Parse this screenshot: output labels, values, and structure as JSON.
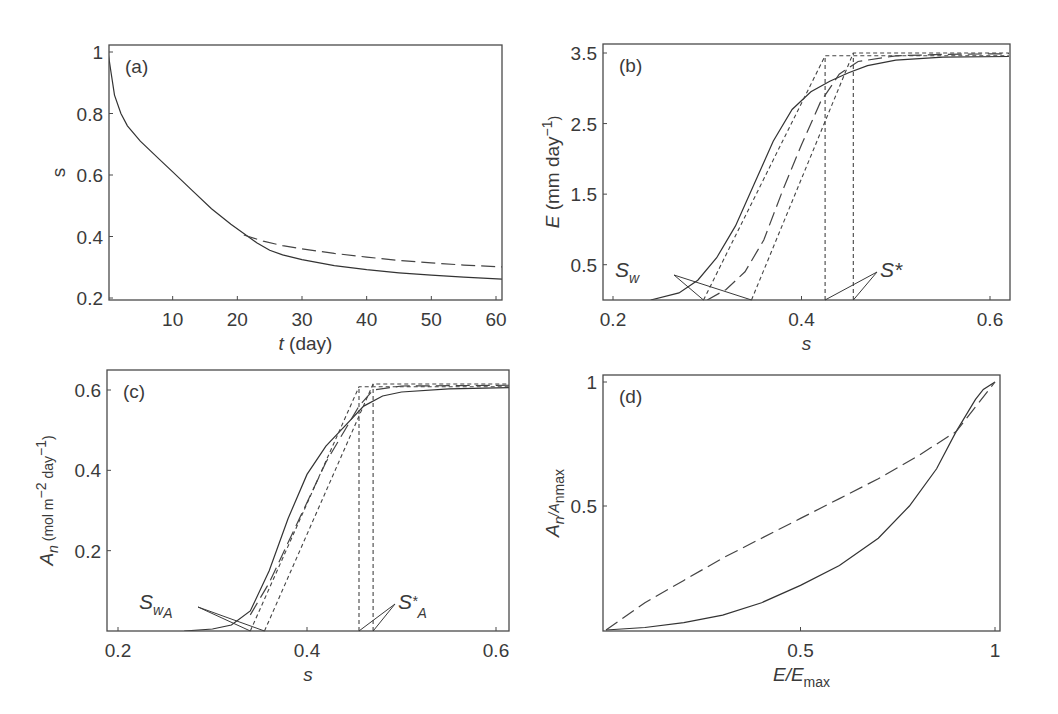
{
  "figure": {
    "panels": [
      {
        "id": "a",
        "label": "(a)"
      },
      {
        "id": "b",
        "label": "(b)"
      },
      {
        "id": "c",
        "label": "(c)"
      },
      {
        "id": "d",
        "label": "(d)"
      }
    ]
  },
  "chart_data": [
    {
      "panel": "(a)",
      "type": "line",
      "xlabel": "t (day)",
      "ylabel": "s",
      "xlim": [
        0,
        62
      ],
      "ylim": [
        0.2,
        1.0
      ],
      "xticks": [
        10,
        20,
        30,
        40,
        50,
        60
      ],
      "yticks": [
        0.2,
        0.4,
        0.6,
        0.8,
        1
      ],
      "grid": false,
      "series": [
        {
          "name": "solid",
          "style": "solid",
          "x": [
            0,
            0.5,
            1,
            2,
            3,
            5,
            8,
            10,
            13,
            16,
            19,
            21,
            23,
            25,
            27,
            30,
            35,
            40,
            45,
            50,
            55,
            62
          ],
          "y": [
            1.0,
            0.93,
            0.86,
            0.8,
            0.76,
            0.71,
            0.65,
            0.61,
            0.55,
            0.49,
            0.44,
            0.41,
            0.38,
            0.355,
            0.34,
            0.325,
            0.305,
            0.292,
            0.282,
            0.274,
            0.268,
            0.26
          ]
        },
        {
          "name": "dashed",
          "style": "dashed",
          "x": [
            21,
            24,
            27,
            30,
            35,
            40,
            45,
            50,
            55,
            62
          ],
          "y": [
            0.405,
            0.385,
            0.37,
            0.36,
            0.345,
            0.333,
            0.322,
            0.314,
            0.307,
            0.3
          ]
        }
      ]
    },
    {
      "panel": "(b)",
      "type": "line",
      "xlabel": "s",
      "ylabel": "E (mm day⁻¹)",
      "xlim": [
        0.19,
        0.62
      ],
      "ylim": [
        0,
        3.6
      ],
      "xticks": [
        0.2,
        0.4,
        0.6
      ],
      "yticks": [
        0.5,
        1.5,
        2.5,
        3.5
      ],
      "grid": false,
      "series": [
        {
          "name": "solid",
          "style": "solid",
          "x": [
            0.24,
            0.27,
            0.29,
            0.31,
            0.33,
            0.35,
            0.37,
            0.39,
            0.41,
            0.43,
            0.45,
            0.47,
            0.5,
            0.55,
            0.62
          ],
          "y": [
            0.0,
            0.1,
            0.28,
            0.6,
            1.05,
            1.65,
            2.25,
            2.7,
            2.95,
            3.1,
            3.22,
            3.32,
            3.4,
            3.44,
            3.45
          ]
        },
        {
          "name": "dashed",
          "style": "dashed",
          "x": [
            0.3,
            0.32,
            0.34,
            0.36,
            0.38,
            0.4,
            0.42,
            0.44,
            0.46,
            0.5,
            0.55,
            0.62
          ],
          "y": [
            0.0,
            0.15,
            0.4,
            0.85,
            1.55,
            2.2,
            2.8,
            3.2,
            3.38,
            3.46,
            3.48,
            3.49
          ]
        },
        {
          "name": "piecewise-linear 1",
          "style": "short-dash",
          "x": [
            0.296,
            0.425,
            0.425,
            0.62
          ],
          "y": [
            0.0,
            3.46,
            3.46,
            3.46
          ]
        },
        {
          "name": "piecewise-linear 2",
          "style": "short-dash",
          "x": [
            0.347,
            0.455,
            0.62
          ],
          "y": [
            0.0,
            3.5,
            3.5
          ]
        },
        {
          "name": "S* vertical 1",
          "style": "short-dash",
          "x": [
            0.425,
            0.425
          ],
          "y": [
            0,
            3.46
          ]
        },
        {
          "name": "S* vertical 2",
          "style": "short-dash",
          "x": [
            0.455,
            0.455
          ],
          "y": [
            0,
            3.5
          ]
        }
      ],
      "annotations": [
        {
          "text": "S_w",
          "targets_s": [
            0.296,
            0.347
          ]
        },
        {
          "text": "S*",
          "targets_s": [
            0.425,
            0.455
          ]
        }
      ]
    },
    {
      "panel": "(c)",
      "type": "line",
      "xlabel": "s",
      "ylabel": "A_n (mol m⁻² day⁻¹)",
      "xlim": [
        0.19,
        0.62
      ],
      "ylim": [
        0,
        0.64
      ],
      "xticks": [
        0.2,
        0.4,
        0.6
      ],
      "yticks": [
        0.2,
        0.4,
        0.6
      ],
      "grid": false,
      "series": [
        {
          "name": "solid",
          "style": "solid",
          "x": [
            0.27,
            0.3,
            0.32,
            0.34,
            0.36,
            0.38,
            0.4,
            0.42,
            0.44,
            0.46,
            0.48,
            0.5,
            0.55,
            0.62
          ],
          "y": [
            0.0,
            0.005,
            0.015,
            0.05,
            0.15,
            0.28,
            0.39,
            0.46,
            0.51,
            0.56,
            0.585,
            0.595,
            0.603,
            0.606
          ]
        },
        {
          "name": "dashed",
          "style": "dashed",
          "x": [
            0.34,
            0.36,
            0.38,
            0.4,
            0.42,
            0.44,
            0.455,
            0.47,
            0.5,
            0.62
          ],
          "y": [
            0.04,
            0.12,
            0.22,
            0.32,
            0.42,
            0.5,
            0.56,
            0.6,
            0.61,
            0.612
          ]
        },
        {
          "name": "piecewise-linear 1",
          "style": "short-dash",
          "x": [
            0.34,
            0.455,
            0.62
          ],
          "y": [
            0.0,
            0.608,
            0.608
          ]
        },
        {
          "name": "piecewise-linear 2",
          "style": "short-dash",
          "x": [
            0.355,
            0.47,
            0.62
          ],
          "y": [
            0.0,
            0.615,
            0.615
          ]
        },
        {
          "name": "S*_A vertical 1",
          "style": "short-dash",
          "x": [
            0.455,
            0.455
          ],
          "y": [
            0,
            0.608
          ]
        },
        {
          "name": "S*_A vertical 2",
          "style": "short-dash",
          "x": [
            0.47,
            0.47
          ],
          "y": [
            0,
            0.615
          ]
        }
      ],
      "annotations": [
        {
          "text": "S_wA",
          "targets_s": [
            0.34,
            0.355
          ]
        },
        {
          "text": "S*_A",
          "targets_s": [
            0.455,
            0.47
          ]
        }
      ]
    },
    {
      "panel": "(d)",
      "type": "line",
      "xlabel": "E/E_max",
      "ylabel": "A_n/A_nmax",
      "xlim": [
        0,
        1.02
      ],
      "ylim": [
        0,
        1.02
      ],
      "xticks": [
        0.5,
        1
      ],
      "yticks": [
        0.5,
        1
      ],
      "grid": false,
      "series": [
        {
          "name": "solid",
          "style": "solid",
          "x": [
            0,
            0.1,
            0.2,
            0.3,
            0.4,
            0.5,
            0.6,
            0.7,
            0.78,
            0.85,
            0.9,
            0.95,
            0.97,
            1.0
          ],
          "y": [
            0,
            0.01,
            0.03,
            0.06,
            0.11,
            0.18,
            0.26,
            0.37,
            0.5,
            0.65,
            0.8,
            0.93,
            0.97,
            1.0
          ]
        },
        {
          "name": "dashed",
          "style": "dashed",
          "x": [
            0,
            0.1,
            0.2,
            0.3,
            0.4,
            0.5,
            0.6,
            0.7,
            0.8,
            0.9,
            1.0
          ],
          "y": [
            0,
            0.11,
            0.2,
            0.29,
            0.37,
            0.45,
            0.53,
            0.61,
            0.7,
            0.8,
            1.0
          ]
        }
      ]
    }
  ]
}
